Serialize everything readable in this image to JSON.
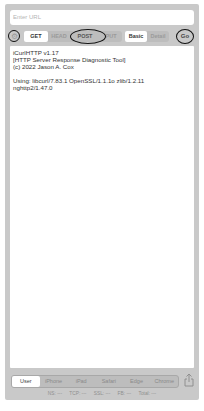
{
  "url_bar": {
    "placeholder": "Enter URL"
  },
  "toolbar": {
    "settings_icon": "⚙",
    "methods": [
      {
        "label": "GET",
        "selected": true
      },
      {
        "label": "HEAD",
        "selected": false
      },
      {
        "label": "POST",
        "selected": false
      },
      {
        "label": "PUT",
        "selected": false
      }
    ],
    "modes": [
      {
        "label": "Basic",
        "selected": true
      },
      {
        "label": "Detail",
        "selected": false
      }
    ],
    "go_label": "Go"
  },
  "output": {
    "lines": [
      "iCurlHTTP v1.17",
      "[HTTP Server Response Diagnostic Tool]",
      "(c) 2022 Jason A. Cox"
    ],
    "using_line": "Using: libcurl/7.83.1 OpenSSL/1.1.1o zlib/1.2.11",
    "using_line2": "nghttp2/1.47.0"
  },
  "user_agents": [
    {
      "label": "User",
      "selected": true
    },
    {
      "label": "iPhone",
      "selected": false
    },
    {
      "label": "iPad",
      "selected": false
    },
    {
      "label": "Safari",
      "selected": false
    },
    {
      "label": "Edge",
      "selected": false
    },
    {
      "label": "Chrome",
      "selected": false
    }
  ],
  "timing": [
    {
      "label": "NS: ---"
    },
    {
      "label": "TCP: ---"
    },
    {
      "label": "SSL: ---"
    },
    {
      "label": "FB: ---"
    },
    {
      "label": "Total: ---"
    }
  ],
  "annotations": {
    "ring_color": "#111111"
  },
  "colors": {
    "panel": "#c9c9c9",
    "segment_bg": "#bdbdbd",
    "selected": "#ffffff"
  }
}
